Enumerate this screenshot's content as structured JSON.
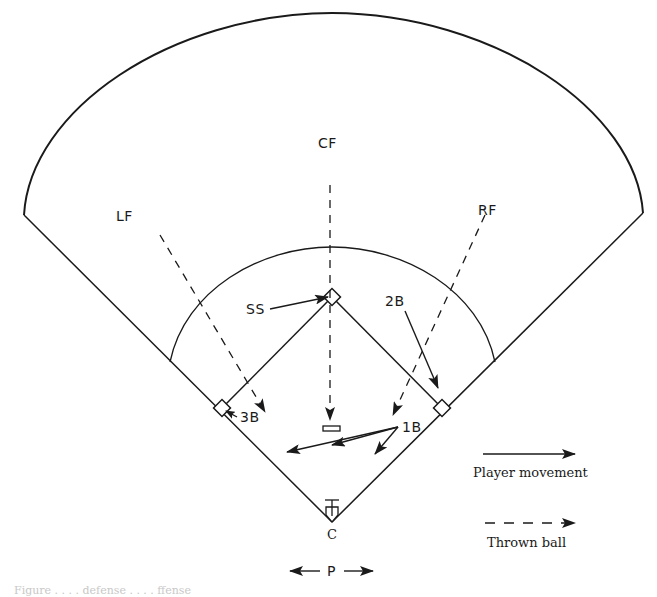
{
  "diagram": {
    "type": "baseball-field-defensive-play",
    "positions": {
      "cf": "CF",
      "lf": "LF",
      "rf": "RF",
      "ss": "SS",
      "second_base": "2B",
      "third_base": "3B",
      "first_base": "1B",
      "catcher": "C",
      "pitcher": "P"
    },
    "legend": {
      "player_movement": "Player movement",
      "thrown_ball": "Thrown ball"
    },
    "caption": "Figure . . . . defense . . . . ffense"
  },
  "colors": {
    "line": "#1a1a1a",
    "background": "#ffffff"
  }
}
